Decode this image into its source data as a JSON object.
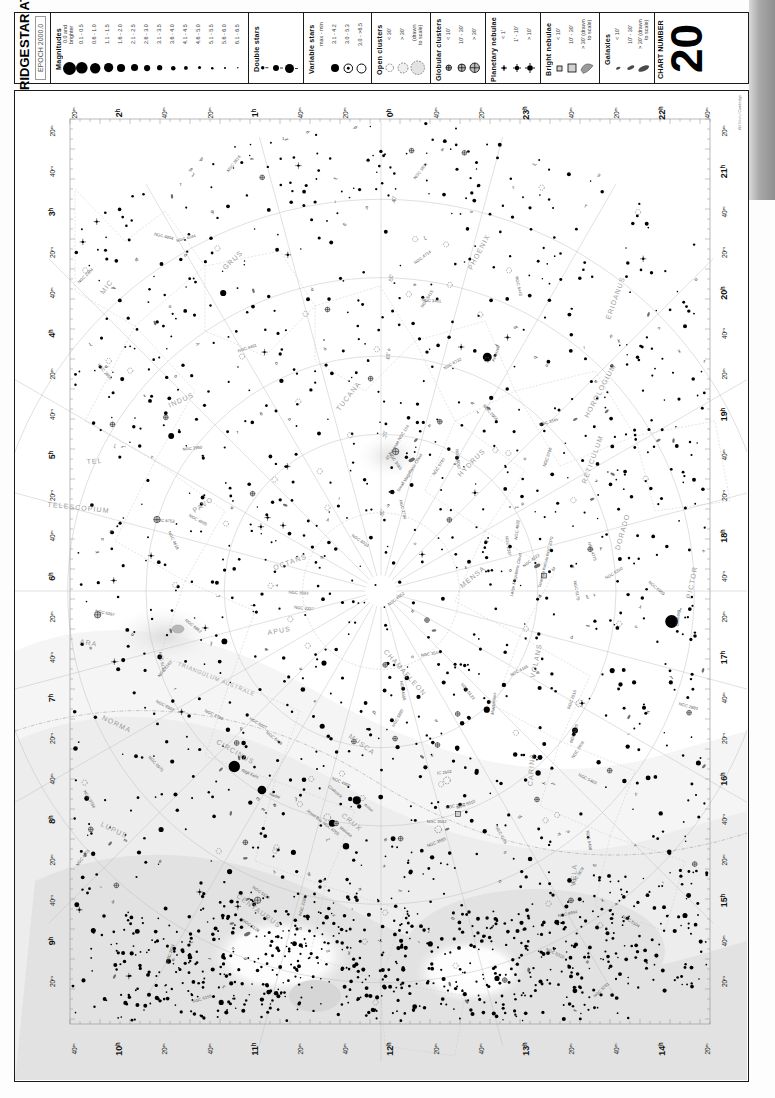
{
  "header": {
    "atlas_title_line1": "CAMBRIDGE",
    "atlas_title_line2": "STAR ATLAS",
    "epoch": "EPOCH 2000.0",
    "chart_number_label": "CHART NUMBER",
    "chart_number": "20",
    "credit": "Wil Tirion  / Cambridge"
  },
  "legend": {
    "magnitudes": {
      "title": "Magnitudes",
      "items": [
        {
          "label": "0.0 and\nbrighter",
          "size": 13.0
        },
        {
          "label": "0.1 - 0.5",
          "size": 11.6
        },
        {
          "label": "0.6 - 1.0",
          "size": 10.4
        },
        {
          "label": "1.1 - 1.5",
          "size": 9.2
        },
        {
          "label": "1.6 - 2.0",
          "size": 8.1
        },
        {
          "label": "2.1 - 2.5",
          "size": 7.1
        },
        {
          "label": "2.6 - 3.0",
          "size": 6.2
        },
        {
          "label": "3.1 - 3.5",
          "size": 5.3
        },
        {
          "label": "3.6 - 4.0",
          "size": 4.5
        },
        {
          "label": "4.1 - 4.5",
          "size": 3.8
        },
        {
          "label": "4.6 - 5.0",
          "size": 3.1
        },
        {
          "label": "5.1 - 5.5",
          "size": 2.5
        },
        {
          "label": "5.6 - 6.0",
          "size": 2.0
        },
        {
          "label": "6.1 - 6.5",
          "size": 1.5
        }
      ]
    },
    "double_stars": {
      "title": "Double stars",
      "items": [
        {
          "size": 3.4
        },
        {
          "size": 6.0
        },
        {
          "size": 9.0
        }
      ]
    },
    "variable_stars": {
      "title": "Variable stars",
      "header": "max - min",
      "items": [
        {
          "label": "3.1 - 4.2",
          "type": "filled",
          "size": 8.0
        },
        {
          "label": "3.0 - 5.3",
          "type": "dot-ring",
          "size": 8.6
        },
        {
          "label": "3.0 - >6.5",
          "type": "open",
          "size": 9.0
        }
      ]
    },
    "open_clusters": {
      "title": "Open clusters",
      "items": [
        {
          "label": "< 30'",
          "size": 7.5,
          "fill": "#ffffff"
        },
        {
          "label": "> 30'",
          "size": 10.0,
          "fill": "#efefef"
        },
        {
          "label": "(drawn\nto scale)",
          "size": 13.5,
          "fill": "#e3e3e3"
        }
      ]
    },
    "globular_clusters": {
      "title": "Globular clusters",
      "items": [
        {
          "label": "< 10'",
          "size": 5.5
        },
        {
          "label": "10' - 30'",
          "size": 7.5
        },
        {
          "label": "> 30'",
          "size": 9.5
        }
      ]
    },
    "planetary_nebulae": {
      "title": "Planetary nebulae",
      "items": [
        {
          "label": "< 1'",
          "size": 6.0
        },
        {
          "label": "1' - 10'",
          "size": 8.0
        },
        {
          "label": "> 10'",
          "size": 10.0
        }
      ]
    },
    "bright_nebulae": {
      "title": "Bright nebulae",
      "items": [
        {
          "label": "< 10'",
          "size": 5.0
        },
        {
          "label": "10' - 30'",
          "size": 8.0
        },
        {
          "label": "> 30' (drawn\nto scale)",
          "size": 13.0
        }
      ]
    },
    "galaxies": {
      "title": "Galaxies",
      "items": [
        {
          "label": "< 10'",
          "w": 4.5,
          "h": 2.4
        },
        {
          "label": "10' - 30'",
          "w": 7.5,
          "h": 3.4
        },
        {
          "label": "> 30' (drawn\nto scale)",
          "w": 11.5,
          "h": 5.0
        }
      ]
    }
  },
  "chart": {
    "ra_top": [
      "20ᵐ",
      "2ʰ",
      "40ᵐ",
      "20ᵐ",
      "1ʰ",
      "40ᵐ",
      "20ᵐ",
      "0ʰ",
      "40ᵐ",
      "20ᵐ",
      "23ʰ",
      "40ᵐ",
      "20ᵐ",
      "22ʰ",
      "40ᵐ"
    ],
    "ra_left": [
      "20ᵐ",
      "40ᵐ",
      "3ʰ",
      "20ᵐ",
      "40ᵐ",
      "4ʰ",
      "20ᵐ",
      "40ᵐ",
      "5ʰ",
      "20ᵐ",
      "40ᵐ",
      "6ʰ",
      "20ᵐ",
      "40ᵐ",
      "7ʰ",
      "20ᵐ",
      "40ᵐ",
      "8ʰ",
      "20ᵐ",
      "40ᵐ",
      "9ʰ",
      "20ᵐ"
    ],
    "ra_right": [
      "20ᵐ",
      "21ʰ",
      "40ᵐ",
      "20ᵐ",
      "20ʰ",
      "40ᵐ",
      "20ᵐ",
      "19ʰ",
      "40ᵐ",
      "20ᵐ",
      "18ʰ",
      "40ᵐ",
      "20ᵐ",
      "17ʰ",
      "40ᵐ",
      "20ᵐ",
      "16ʰ",
      "40ᵐ",
      "20ᵐ",
      "15ʰ",
      "40ᵐ",
      "20ᵐ"
    ],
    "ra_bottom": [
      "40ᵐ",
      "10ʰ",
      "20ᵐ",
      "40ᵐ",
      "11ʰ",
      "20ᵐ",
      "40ᵐ",
      "12ʰ",
      "20ᵐ",
      "40ᵐ",
      "13ʰ",
      "20ᵐ",
      "40ᵐ",
      "14ʰ",
      "20ᵐ"
    ],
    "declinations": [
      "-40°",
      "-50°",
      "-60°",
      "-70°",
      "-80°"
    ],
    "constellations": [
      "PHOENIX",
      "ERIDANUS",
      "HOROLOGIUM",
      "RETICULUM",
      "HYDRUS",
      "DORADO",
      "PICTOR",
      "VOLANS",
      "CARINA",
      "MENSA",
      "TUCANA",
      "INDUS",
      "OCTANS",
      "PAVO",
      "APUS",
      "CHAMAELEON",
      "MUSCA",
      "CIRCINUS",
      "TRIANGULUM AUSTRALE",
      "NORMA",
      "ARA",
      "TELESCOPIUM",
      "GRUS",
      "MIC",
      "CRUX",
      "CENTAURUS",
      "LUPUS",
      "VELA",
      "TEL",
      "INDUS"
    ],
    "objects": [
      "Achernar",
      "Canopus",
      "Rigil Kent.",
      "Hadar",
      "Acrux",
      "Mimosa",
      "Small Magellanic Cloud",
      "Large Magellanic Cloud",
      "47 Tucanae NGC 104",
      "Tarantula Nebula NGC 2070",
      "Coalsack",
      "Jewel Box NGC 4755",
      "NGC 3372",
      "NGC 2516",
      "NGC 3532",
      "NGC 6752",
      "NGC 5139",
      "NGC 3114",
      "NGC 2070",
      "IC 2602",
      "NGC 4833",
      "NGC 6397",
      "NGC 5128"
    ]
  },
  "chart_data": {
    "type": "scatter",
    "xlabel": "Right Ascension",
    "ylabel": "Declination",
    "projection": "south polar azimuthal",
    "xlim": [
      "22h",
      "14h"
    ],
    "ylim": [
      -90,
      -30
    ],
    "grid": true,
    "legend": "top (magnitude key)",
    "declination_circles": [
      -40,
      -50,
      -60,
      -70,
      -80
    ],
    "bright_stars": [
      {
        "name": "Achernar",
        "con": "Eridanus",
        "ra_h": 1.63,
        "dec": -57.2,
        "mag": 0.5
      },
      {
        "name": "Canopus",
        "con": "Carina",
        "ra_h": 6.4,
        "dec": -52.7,
        "mag": -0.7
      },
      {
        "name": "Rigil Kentaurus",
        "con": "Centaurus",
        "ra_h": 14.66,
        "dec": -60.8,
        "mag": -0.3
      },
      {
        "name": "Hadar",
        "con": "Centaurus",
        "ra_h": 14.06,
        "dec": -60.4,
        "mag": 0.6
      },
      {
        "name": "Acrux",
        "con": "Crux",
        "ra_h": 12.44,
        "dec": -63.1,
        "mag": 0.8
      },
      {
        "name": "Mimosa",
        "con": "Crux",
        "ra_h": 12.79,
        "dec": -59.7,
        "mag": 1.3
      },
      {
        "name": "Gacrux",
        "con": "Crux",
        "ra_h": 12.52,
        "dec": -57.1,
        "mag": 1.6
      },
      {
        "name": "Miaplacidus",
        "con": "Carina",
        "ra_h": 9.22,
        "dec": -69.7,
        "mag": 1.7
      },
      {
        "name": "Avior",
        "con": "Carina",
        "ra_h": 8.38,
        "dec": -59.5,
        "mag": 1.9
      },
      {
        "name": "Aspidiske",
        "con": "Carina",
        "ra_h": 9.28,
        "dec": -59.3,
        "mag": 2.2
      },
      {
        "name": "Atria",
        "con": "Triangulum Australe",
        "ra_h": 16.81,
        "dec": -69.0,
        "mag": 1.9
      },
      {
        "name": "Alpha Pavonis",
        "con": "Pavo",
        "ra_h": 20.43,
        "dec": -56.7,
        "mag": 1.9
      },
      {
        "name": "Alpha Gruis",
        "con": "Grus",
        "ra_h": 22.14,
        "dec": -46.96,
        "mag": 1.7
      },
      {
        "name": "Alpha Hydri",
        "con": "Hydrus",
        "ra_h": 1.98,
        "dec": -61.6,
        "mag": 2.9
      },
      {
        "name": "Beta Hydri",
        "con": "Hydrus",
        "ra_h": 0.43,
        "dec": -77.3,
        "mag": 2.8
      },
      {
        "name": "Alpha Tucanae",
        "con": "Tucana",
        "ra_h": 22.31,
        "dec": -60.3,
        "mag": 2.9
      },
      {
        "name": "Alpha Indi",
        "con": "Indus",
        "ra_h": 20.62,
        "dec": -47.3,
        "mag": 3.1
      },
      {
        "name": "Sigma Octantis",
        "con": "Octans",
        "ra_h": 21.14,
        "dec": -88.96,
        "mag": 5.5
      }
    ],
    "deep_sky": [
      {
        "name": "Large Magellanic Cloud",
        "type": "galaxy",
        "ra_h": 5.39,
        "dec": -69.8
      },
      {
        "name": "Small Magellanic Cloud",
        "type": "galaxy",
        "ra_h": 0.88,
        "dec": -72.8
      },
      {
        "name": "47 Tucanae NGC 104",
        "type": "globular",
        "ra_h": 0.4,
        "dec": -72.1
      },
      {
        "name": "Tarantula Nebula NGC 2070",
        "type": "bright-nebula",
        "ra_h": 5.64,
        "dec": -69.1
      },
      {
        "name": "NGC 5139 Omega Centauri",
        "type": "globular",
        "ra_h": 13.45,
        "dec": -47.5
      },
      {
        "name": "NGC 3372 Eta Carinae Nebula",
        "type": "bright-nebula",
        "ra_h": 10.73,
        "dec": -59.9
      },
      {
        "name": "NGC 4755 Jewel Box",
        "type": "open-cluster",
        "ra_h": 12.89,
        "dec": -60.3
      },
      {
        "name": "Coalsack",
        "type": "dark-nebula",
        "ra_h": 12.87,
        "dec": -63.0
      },
      {
        "name": "NGC 6752",
        "type": "globular",
        "ra_h": 19.18,
        "dec": -59.98
      },
      {
        "name": "NGC 2516",
        "type": "open-cluster",
        "ra_h": 7.97,
        "dec": -60.9
      },
      {
        "name": "NGC 3532",
        "type": "open-cluster",
        "ra_h": 11.1,
        "dec": -58.7
      },
      {
        "name": "IC 2602",
        "type": "open-cluster",
        "ra_h": 10.72,
        "dec": -64.4
      },
      {
        "name": "NGC 6397",
        "type": "globular",
        "ra_h": 17.68,
        "dec": -53.7
      },
      {
        "name": "NGC 5128 Centaurus A",
        "type": "galaxy",
        "ra_h": 13.42,
        "dec": -43.0
      }
    ]
  }
}
